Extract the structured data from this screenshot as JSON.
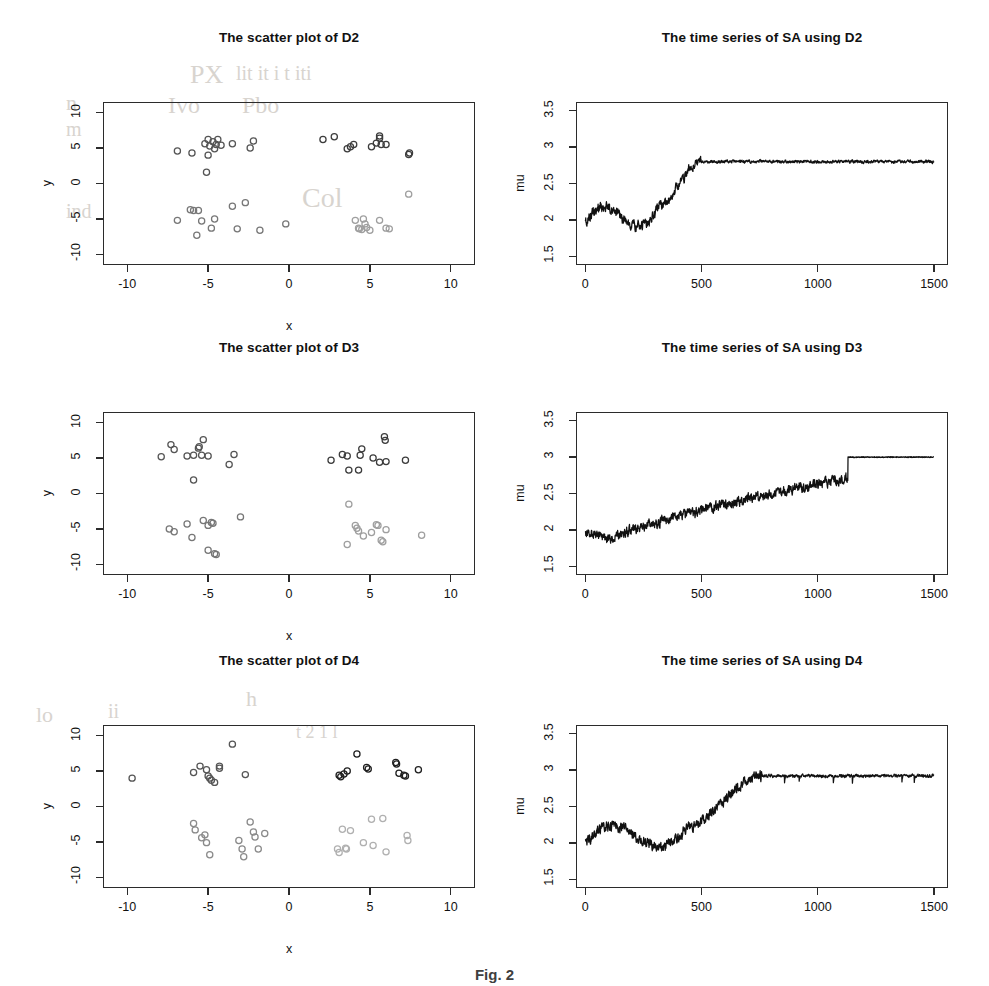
{
  "figure": {
    "caption": "Fig. 2",
    "background": "#ffffff",
    "axis_color": "#2b2b2b"
  },
  "panels": [
    {
      "id": "scatter-d2",
      "title": "The scatter plot of D2",
      "xlabel": "x",
      "ylabel": "y"
    },
    {
      "id": "series-d2",
      "title": "The time series of SA using D2",
      "xlabel": "",
      "ylabel": "mu"
    },
    {
      "id": "scatter-d3",
      "title": "The scatter plot of D3",
      "xlabel": "x",
      "ylabel": "y"
    },
    {
      "id": "series-d3",
      "title": "The time series of SA using D3",
      "xlabel": "",
      "ylabel": "mu"
    },
    {
      "id": "scatter-d4",
      "title": "The scatter plot of D4",
      "xlabel": "x",
      "ylabel": "y"
    },
    {
      "id": "series-d4",
      "title": "The time series of SA using D4",
      "xlabel": "",
      "ylabel": "mu"
    }
  ],
  "ghost_text": [
    {
      "text": "PX",
      "x": 190,
      "y": 60,
      "size": 26
    },
    {
      "text": "lit it i t iti",
      "x": 236,
      "y": 62,
      "size": 20
    },
    {
      "text": "n",
      "x": 66,
      "y": 90,
      "size": 22
    },
    {
      "text": "Ivo",
      "x": 168,
      "y": 92,
      "size": 24
    },
    {
      "text": "Pbo",
      "x": 242,
      "y": 92,
      "size": 24
    },
    {
      "text": "m",
      "x": 66,
      "y": 118,
      "size": 20
    },
    {
      "text": "Col",
      "x": 302,
      "y": 182,
      "size": 28
    },
    {
      "text": "ind",
      "x": 66,
      "y": 200,
      "size": 20
    },
    {
      "text": "lo",
      "x": 36,
      "y": 702,
      "size": 22
    },
    {
      "text": "ii",
      "x": 108,
      "y": 700,
      "size": 20
    },
    {
      "text": "h",
      "x": 246,
      "y": 686,
      "size": 22
    },
    {
      "text": "t 2 1 l",
      "x": 296,
      "y": 722,
      "size": 18
    }
  ],
  "chart_data": [
    {
      "type": "scatter",
      "title": "The scatter plot of D2",
      "xlabel": "x",
      "ylabel": "y",
      "xlim": [
        -11.5,
        11.5
      ],
      "ylim": [
        -11.5,
        11.5
      ],
      "xticks": [
        -10,
        -5,
        0,
        5,
        10
      ],
      "yticks": [
        -10,
        -5,
        0,
        5,
        10
      ],
      "grid": false,
      "legend": "none",
      "series": [
        {
          "name": "cluster-top-left",
          "color": "#555555",
          "points": [
            [
              -6.9,
              4.6
            ],
            [
              -6.0,
              4.3
            ],
            [
              -5.2,
              5.6
            ],
            [
              -5.0,
              6.2
            ],
            [
              -4.9,
              5.3
            ],
            [
              -4.7,
              5.9
            ],
            [
              -4.6,
              4.9
            ],
            [
              -4.5,
              5.5
            ],
            [
              -4.4,
              6.2
            ],
            [
              -4.2,
              5.4
            ],
            [
              -3.5,
              5.6
            ],
            [
              -2.2,
              6.0
            ],
            [
              -2.4,
              5.0
            ],
            [
              -5.1,
              1.6
            ],
            [
              -5.0,
              4.0
            ]
          ]
        },
        {
          "name": "cluster-top-right",
          "color": "#3c3c3c",
          "points": [
            [
              2.1,
              6.2
            ],
            [
              2.8,
              6.6
            ],
            [
              3.6,
              4.9
            ],
            [
              3.8,
              5.2
            ],
            [
              4.0,
              5.5
            ],
            [
              5.1,
              5.2
            ],
            [
              5.4,
              5.7
            ],
            [
              5.6,
              6.7
            ],
            [
              5.6,
              6.4
            ],
            [
              5.7,
              5.5
            ],
            [
              6.0,
              5.5
            ],
            [
              7.4,
              4.1
            ],
            [
              7.45,
              4.3
            ]
          ]
        },
        {
          "name": "cluster-bottom-left",
          "color": "#777777",
          "points": [
            [
              -6.9,
              -5.2
            ],
            [
              -6.1,
              -3.7
            ],
            [
              -5.9,
              -3.8
            ],
            [
              -5.7,
              -7.3
            ],
            [
              -5.6,
              -3.8
            ],
            [
              -5.4,
              -5.3
            ],
            [
              -4.8,
              -6.3
            ],
            [
              -4.6,
              -5.0
            ],
            [
              -3.5,
              -3.2
            ],
            [
              -3.2,
              -6.4
            ],
            [
              -2.7,
              -2.7
            ],
            [
              -1.8,
              -6.6
            ],
            [
              -0.2,
              -5.7
            ]
          ]
        },
        {
          "name": "cluster-bottom-right",
          "color": "#9f9f9f",
          "points": [
            [
              4.1,
              -5.2
            ],
            [
              4.3,
              -6.3
            ],
            [
              4.35,
              -6.4
            ],
            [
              4.5,
              -6.5
            ],
            [
              4.6,
              -5.0
            ],
            [
              4.7,
              -5.7
            ],
            [
              4.8,
              -6.2
            ],
            [
              5.0,
              -6.6
            ],
            [
              5.6,
              -5.2
            ],
            [
              6.0,
              -6.3
            ],
            [
              6.2,
              -6.4
            ],
            [
              7.4,
              -1.5
            ]
          ]
        }
      ]
    },
    {
      "type": "line",
      "title": "The time series of SA using D2",
      "xlabel": "",
      "ylabel": "mu",
      "xlim": [
        -40,
        1560
      ],
      "ylim": [
        1.38,
        3.62
      ],
      "xticks": [
        0,
        500,
        1000,
        1500
      ],
      "yticks": [
        1.5,
        2.0,
        2.5,
        3.0,
        3.5
      ],
      "grid": false,
      "line_color": "#111111",
      "plateau": 2.8,
      "start": 1.95
    },
    {
      "type": "scatter",
      "title": "The scatter plot of D3",
      "xlabel": "x",
      "ylabel": "y",
      "xlim": [
        -11.5,
        11.5
      ],
      "ylim": [
        -11.5,
        11.5
      ],
      "xticks": [
        -10,
        -5,
        0,
        5,
        10
      ],
      "yticks": [
        -10,
        -5,
        0,
        5,
        10
      ],
      "grid": false,
      "legend": "none",
      "series": [
        {
          "name": "cluster-top-left",
          "color": "#555555",
          "points": [
            [
              -7.9,
              5.2
            ],
            [
              -7.3,
              6.9
            ],
            [
              -7.1,
              6.2
            ],
            [
              -6.3,
              5.3
            ],
            [
              -5.9,
              5.4
            ],
            [
              -5.6,
              6.4
            ],
            [
              -5.55,
              6.6
            ],
            [
              -5.4,
              5.4
            ],
            [
              -5.3,
              7.6
            ],
            [
              -5.0,
              5.3
            ],
            [
              -5.9,
              1.9
            ],
            [
              -3.4,
              5.5
            ],
            [
              -3.7,
              4.1
            ]
          ]
        },
        {
          "name": "cluster-top-right",
          "color": "#3c3c3c",
          "points": [
            [
              2.6,
              4.7
            ],
            [
              3.3,
              5.5
            ],
            [
              3.6,
              5.3
            ],
            [
              3.7,
              3.3
            ],
            [
              4.3,
              3.3
            ],
            [
              4.4,
              5.4
            ],
            [
              4.5,
              6.3
            ],
            [
              5.2,
              5.0
            ],
            [
              5.6,
              4.4
            ],
            [
              5.9,
              8.0
            ],
            [
              5.95,
              7.5
            ],
            [
              6.0,
              4.5
            ],
            [
              7.2,
              4.7
            ]
          ]
        },
        {
          "name": "cluster-bottom-left",
          "color": "#777777",
          "points": [
            [
              -7.4,
              -5.0
            ],
            [
              -7.1,
              -5.4
            ],
            [
              -6.3,
              -4.3
            ],
            [
              -6.0,
              -6.2
            ],
            [
              -5.3,
              -3.8
            ],
            [
              -5.0,
              -4.5
            ],
            [
              -4.8,
              -4.1
            ],
            [
              -4.7,
              -4.2
            ],
            [
              -5.0,
              -8.0
            ],
            [
              -4.6,
              -8.5
            ],
            [
              -4.5,
              -8.6
            ],
            [
              -3.0,
              -3.3
            ]
          ]
        },
        {
          "name": "cluster-bottom-right",
          "color": "#9f9f9f",
          "points": [
            [
              3.7,
              -1.5
            ],
            [
              3.6,
              -7.2
            ],
            [
              4.1,
              -4.5
            ],
            [
              4.2,
              -4.9
            ],
            [
              4.3,
              -5.3
            ],
            [
              4.6,
              -6.0
            ],
            [
              5.1,
              -5.5
            ],
            [
              5.4,
              -4.4
            ],
            [
              5.5,
              -4.5
            ],
            [
              5.7,
              -6.6
            ],
            [
              5.8,
              -6.8
            ],
            [
              6.0,
              -5.1
            ],
            [
              8.2,
              -5.9
            ]
          ]
        }
      ]
    },
    {
      "type": "line",
      "title": "The time series of SA using D3",
      "xlabel": "",
      "ylabel": "mu",
      "xlim": [
        -40,
        1560
      ],
      "ylim": [
        1.38,
        3.62
      ],
      "xticks": [
        0,
        500,
        1000,
        1500
      ],
      "yticks": [
        1.5,
        2.0,
        2.5,
        3.0,
        3.5
      ],
      "grid": false,
      "line_color": "#111111",
      "plateau": 3.0,
      "start": 1.98
    },
    {
      "type": "scatter",
      "title": "The scatter plot of D4",
      "xlabel": "x",
      "ylabel": "y",
      "xlim": [
        -11.5,
        11.5
      ],
      "ylim": [
        -11.5,
        11.5
      ],
      "xticks": [
        -10,
        -5,
        0,
        5,
        10
      ],
      "yticks": [
        -10,
        -5,
        0,
        5,
        10
      ],
      "grid": false,
      "legend": "none",
      "series": [
        {
          "name": "cluster-top-left",
          "color": "#555555",
          "points": [
            [
              -9.7,
              4.0
            ],
            [
              -5.9,
              4.8
            ],
            [
              -5.5,
              5.7
            ],
            [
              -5.1,
              5.2
            ],
            [
              -5.0,
              4.3
            ],
            [
              -4.9,
              4.0
            ],
            [
              -4.8,
              3.7
            ],
            [
              -4.6,
              3.4
            ],
            [
              -4.3,
              5.7
            ],
            [
              -4.3,
              5.4
            ],
            [
              -3.5,
              8.8
            ],
            [
              -2.7,
              4.5
            ]
          ]
        },
        {
          "name": "cluster-top-right",
          "color": "#1f1f1f",
          "points": [
            [
              3.1,
              4.4
            ],
            [
              3.2,
              4.2
            ],
            [
              3.4,
              4.6
            ],
            [
              3.6,
              5.0
            ],
            [
              4.2,
              7.4
            ],
            [
              4.8,
              5.5
            ],
            [
              4.9,
              5.3
            ],
            [
              6.6,
              6.2
            ],
            [
              6.65,
              6.0
            ],
            [
              6.8,
              4.7
            ],
            [
              7.1,
              4.4
            ],
            [
              7.2,
              4.3
            ],
            [
              8.0,
              5.2
            ]
          ]
        },
        {
          "name": "cluster-bottom-left",
          "color": "#8a8a8a",
          "points": [
            [
              -5.9,
              -2.4
            ],
            [
              -5.8,
              -3.3
            ],
            [
              -5.4,
              -4.4
            ],
            [
              -5.2,
              -4.0
            ],
            [
              -5.1,
              -5.1
            ],
            [
              -4.9,
              -6.8
            ],
            [
              -3.1,
              -4.8
            ],
            [
              -2.9,
              -6.0
            ],
            [
              -2.8,
              -7.1
            ],
            [
              -2.4,
              -2.2
            ],
            [
              -2.2,
              -3.6
            ],
            [
              -2.1,
              -4.3
            ],
            [
              -1.9,
              -6.0
            ],
            [
              -1.5,
              -3.8
            ]
          ]
        },
        {
          "name": "cluster-bottom-right",
          "color": "#b0b0b0",
          "points": [
            [
              3.0,
              -6.0
            ],
            [
              3.1,
              -6.5
            ],
            [
              3.3,
              -3.2
            ],
            [
              3.5,
              -5.9
            ],
            [
              3.55,
              -6.0
            ],
            [
              3.8,
              -3.4
            ],
            [
              4.6,
              -5.1
            ],
            [
              5.1,
              -1.8
            ],
            [
              5.2,
              -5.5
            ],
            [
              5.8,
              -1.7
            ],
            [
              6.0,
              -6.4
            ],
            [
              7.3,
              -4.1
            ],
            [
              7.35,
              -4.8
            ]
          ]
        }
      ]
    },
    {
      "type": "line",
      "title": "The time series of SA using D4",
      "xlabel": "",
      "ylabel": "mu",
      "xlim": [
        -40,
        1560
      ],
      "ylim": [
        1.38,
        3.62
      ],
      "xticks": [
        0,
        500,
        1000,
        1500
      ],
      "yticks": [
        1.5,
        2.0,
        2.5,
        3.0,
        3.5
      ],
      "grid": false,
      "line_color": "#111111",
      "plateau": 2.92,
      "start": 2.0
    }
  ]
}
